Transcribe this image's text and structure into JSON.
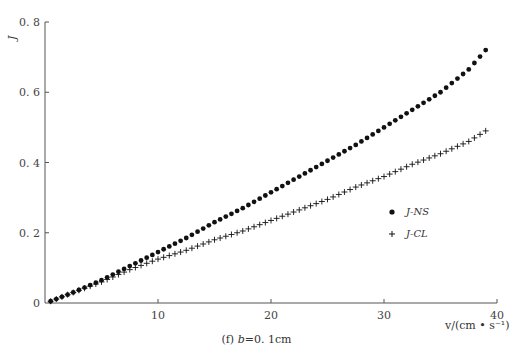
{
  "chart_data": {
    "type": "scatter",
    "title": "",
    "caption": "(f) b=0.1cm",
    "caption_prefix": "(f)",
    "caption_var": "b",
    "caption_value": "=0. 1cm",
    "xlabel": "v/(cm • s⁻¹)",
    "ylabel": "J",
    "xlim": [
      0,
      40
    ],
    "ylim": [
      0,
      0.8
    ],
    "xticks": [
      10,
      20,
      30,
      40
    ],
    "xtick_labels": [
      "10",
      "20",
      "30",
      "40"
    ],
    "yticks": [
      0,
      0.2,
      0.4,
      0.6,
      0.8
    ],
    "ytick_labels": [
      "0",
      "0. 2",
      "0. 4",
      "0. 6",
      "0. 8"
    ],
    "grid": false,
    "legend_position": "right-middle",
    "series": [
      {
        "name": "J-NS",
        "marker": "dot",
        "x": [
          0.5,
          2.5,
          5,
          7.5,
          10,
          12.5,
          15,
          17.5,
          20,
          22.5,
          25,
          27.5,
          30,
          32.5,
          35,
          37.5,
          39
        ],
        "values": [
          0.005,
          0.03,
          0.065,
          0.105,
          0.145,
          0.185,
          0.23,
          0.27,
          0.315,
          0.36,
          0.405,
          0.45,
          0.5,
          0.55,
          0.6,
          0.665,
          0.72
        ]
      },
      {
        "name": "J-CL",
        "marker": "plus",
        "x": [
          0.5,
          2.5,
          5,
          7.5,
          10,
          12.5,
          15,
          17.5,
          20,
          22.5,
          25,
          27.5,
          30,
          32.5,
          35,
          37.5,
          39
        ],
        "values": [
          0.005,
          0.03,
          0.06,
          0.095,
          0.125,
          0.15,
          0.18,
          0.205,
          0.235,
          0.265,
          0.295,
          0.33,
          0.36,
          0.395,
          0.425,
          0.46,
          0.49
        ]
      }
    ]
  },
  "legend": {
    "items": [
      {
        "label": "J-NS",
        "marker": "dot"
      },
      {
        "label": "J-CL",
        "marker": "plus"
      }
    ]
  },
  "colors": {
    "axis": "#555555",
    "marker": "#111111",
    "text": "#333333"
  }
}
